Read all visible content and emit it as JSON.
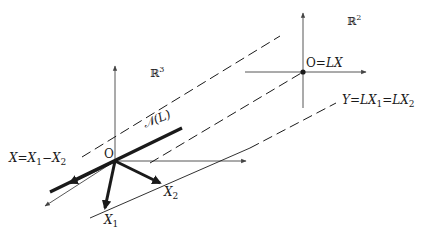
{
  "diagram": {
    "type": "linear-map-geometry",
    "spaces": {
      "domain": {
        "label": "ℝ",
        "exponent": "3"
      },
      "codomain": {
        "label": "ℝ",
        "exponent": "2"
      }
    },
    "labels": {
      "origin_domain": "O",
      "origin_codomain": "O=",
      "origin_codomain_expr": "LX",
      "kernel": "𝒩(L)",
      "x_vector_lhs": "X",
      "x_vector_eq": "=",
      "x_vector_a": "X",
      "x_vector_a_sub": "1",
      "x_vector_minus": "−",
      "x_vector_b": "X",
      "x_vector_b_sub": "2",
      "x1": "X",
      "x1_sub": "1",
      "x2": "X",
      "x2_sub": "2",
      "y_lhs": "Y",
      "y_eq1": "=",
      "y_mid": "LX",
      "y_mid_sub": "1",
      "y_eq2": "=",
      "y_rhs": "LX",
      "y_rhs_sub": "2"
    },
    "colors": {
      "ink": "#1a1a1a",
      "thin": "#444444",
      "background": "#ffffff"
    }
  }
}
